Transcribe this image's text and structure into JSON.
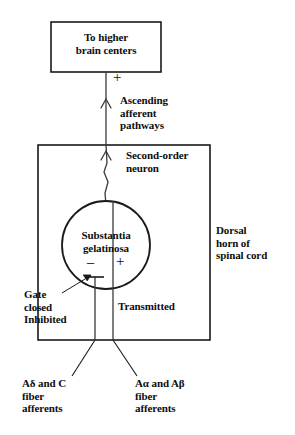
{
  "figure": {
    "stroke_color": "#1a1a1a",
    "text_color": "#0d0d0d",
    "background_color": "#ffffff"
  },
  "boxes": {
    "brain": {
      "label": "To higher\nbrain centers"
    },
    "dorsal_horn": {
      "label": "Dorsal\nhorn of\nspinal cord"
    }
  },
  "nodes": {
    "substantia": {
      "label": "Substantia\ngelatinosa"
    }
  },
  "pathways": {
    "ascending": {
      "label": "Ascending\nafferent\npathways"
    },
    "second_order": {
      "label": "Second-order\nneuron"
    },
    "inhibited": {
      "label": "Gate\nclosed\nInhibited"
    },
    "transmitted": {
      "label": "Transmitted"
    },
    "small_fibers": {
      "label": "Aδ and C\nfiber\nafferents"
    },
    "large_fibers": {
      "label": "Aα and Aβ\nfiber\nafferents"
    }
  },
  "signs": {
    "plus_to_brain": "+",
    "minus_gate": "−",
    "plus_gate": "+"
  }
}
